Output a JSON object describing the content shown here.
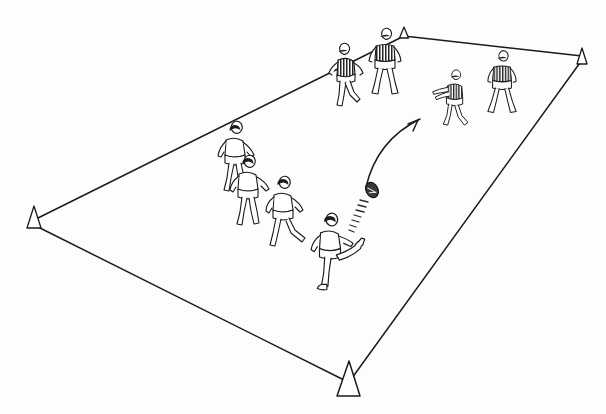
{
  "diagram": {
    "title": "Kick and catch drill within coned grid",
    "type": "sports-coaching-line-drawing",
    "canvas": {
      "width": 606,
      "height": 414
    },
    "background_color": "#fdfdfc",
    "ink_color": "#1a1a1a",
    "stroke_width": 1.4
  },
  "field": {
    "name": "coned-playing-grid",
    "shape": "quadrilateral-perspective",
    "corners": [
      {
        "label": "top-cone",
        "x": 404,
        "y": 36
      },
      {
        "label": "right-cone",
        "x": 582,
        "y": 58
      },
      {
        "label": "bottom-cone",
        "x": 350,
        "y": 382
      },
      {
        "label": "left-cone",
        "x": 34,
        "y": 222
      }
    ],
    "edges": [
      {
        "from": "top-cone",
        "to": "right-cone"
      },
      {
        "from": "right-cone",
        "to": "bottom-cone"
      },
      {
        "from": "bottom-cone",
        "to": "left-cone"
      },
      {
        "from": "left-cone",
        "to": "top-cone"
      }
    ]
  },
  "cones": [
    {
      "id": "cone-top",
      "x": 404,
      "y": 36,
      "size": 11,
      "fill": "#ffffff"
    },
    {
      "id": "cone-right",
      "x": 582,
      "y": 58,
      "size": 13,
      "fill": "#ffffff"
    },
    {
      "id": "cone-bottom",
      "x": 350,
      "y": 382,
      "size": 25,
      "fill": "#ffffff"
    },
    {
      "id": "cone-left",
      "x": 34,
      "y": 222,
      "size": 16,
      "fill": "#ffffff"
    }
  ],
  "players": [
    {
      "id": "player-dark-1",
      "team": "dark",
      "jersey": "striped",
      "x": 346,
      "y": 80,
      "scale": 1.0,
      "pose": "running-left",
      "facing": "left"
    },
    {
      "id": "player-dark-2",
      "team": "dark",
      "jersey": "striped",
      "x": 385,
      "y": 68,
      "scale": 1.0,
      "pose": "standing-ready",
      "facing": "front"
    },
    {
      "id": "player-dark-3",
      "team": "dark",
      "jersey": "striped",
      "x": 502,
      "y": 88,
      "scale": 0.94,
      "pose": "standing-ready",
      "facing": "front"
    },
    {
      "id": "player-light-catch",
      "team": "light",
      "jersey": "plain",
      "x": 453,
      "y": 104,
      "scale": 0.88,
      "pose": "catching-arms-out",
      "facing": "left"
    },
    {
      "id": "player-light-1",
      "team": "light",
      "jersey": "plain",
      "x": 235,
      "y": 163,
      "scale": 1.0,
      "pose": "running-away",
      "facing": "back"
    },
    {
      "id": "player-light-2",
      "team": "light",
      "jersey": "plain",
      "x": 248,
      "y": 197,
      "scale": 1.0,
      "pose": "running-away",
      "facing": "back"
    },
    {
      "id": "player-light-3",
      "team": "light",
      "jersey": "plain",
      "x": 283,
      "y": 218,
      "scale": 1.0,
      "pose": "running-away",
      "facing": "back"
    },
    {
      "id": "player-light-kicker",
      "team": "light",
      "jersey": "plain",
      "x": 330,
      "y": 257,
      "scale": 1.05,
      "pose": "kicking",
      "facing": "back"
    }
  ],
  "ball": {
    "id": "ball",
    "shape": "oval",
    "x": 372,
    "y": 190,
    "rx": 6,
    "ry": 8,
    "rotation_deg": -28,
    "fill": "#3a3a3a"
  },
  "motion_trail": {
    "id": "ball-motion-trail",
    "from": {
      "x": 366,
      "y": 198
    },
    "to": {
      "x": 348,
      "y": 227
    },
    "dash_count": 8
  },
  "trajectory_arrow": {
    "id": "pass-trajectory-arrow",
    "start": {
      "x": 366,
      "y": 187
    },
    "control": {
      "x": 377,
      "y": 140
    },
    "end": {
      "x": 420,
      "y": 119
    },
    "arrowhead": true,
    "style": "curved"
  }
}
